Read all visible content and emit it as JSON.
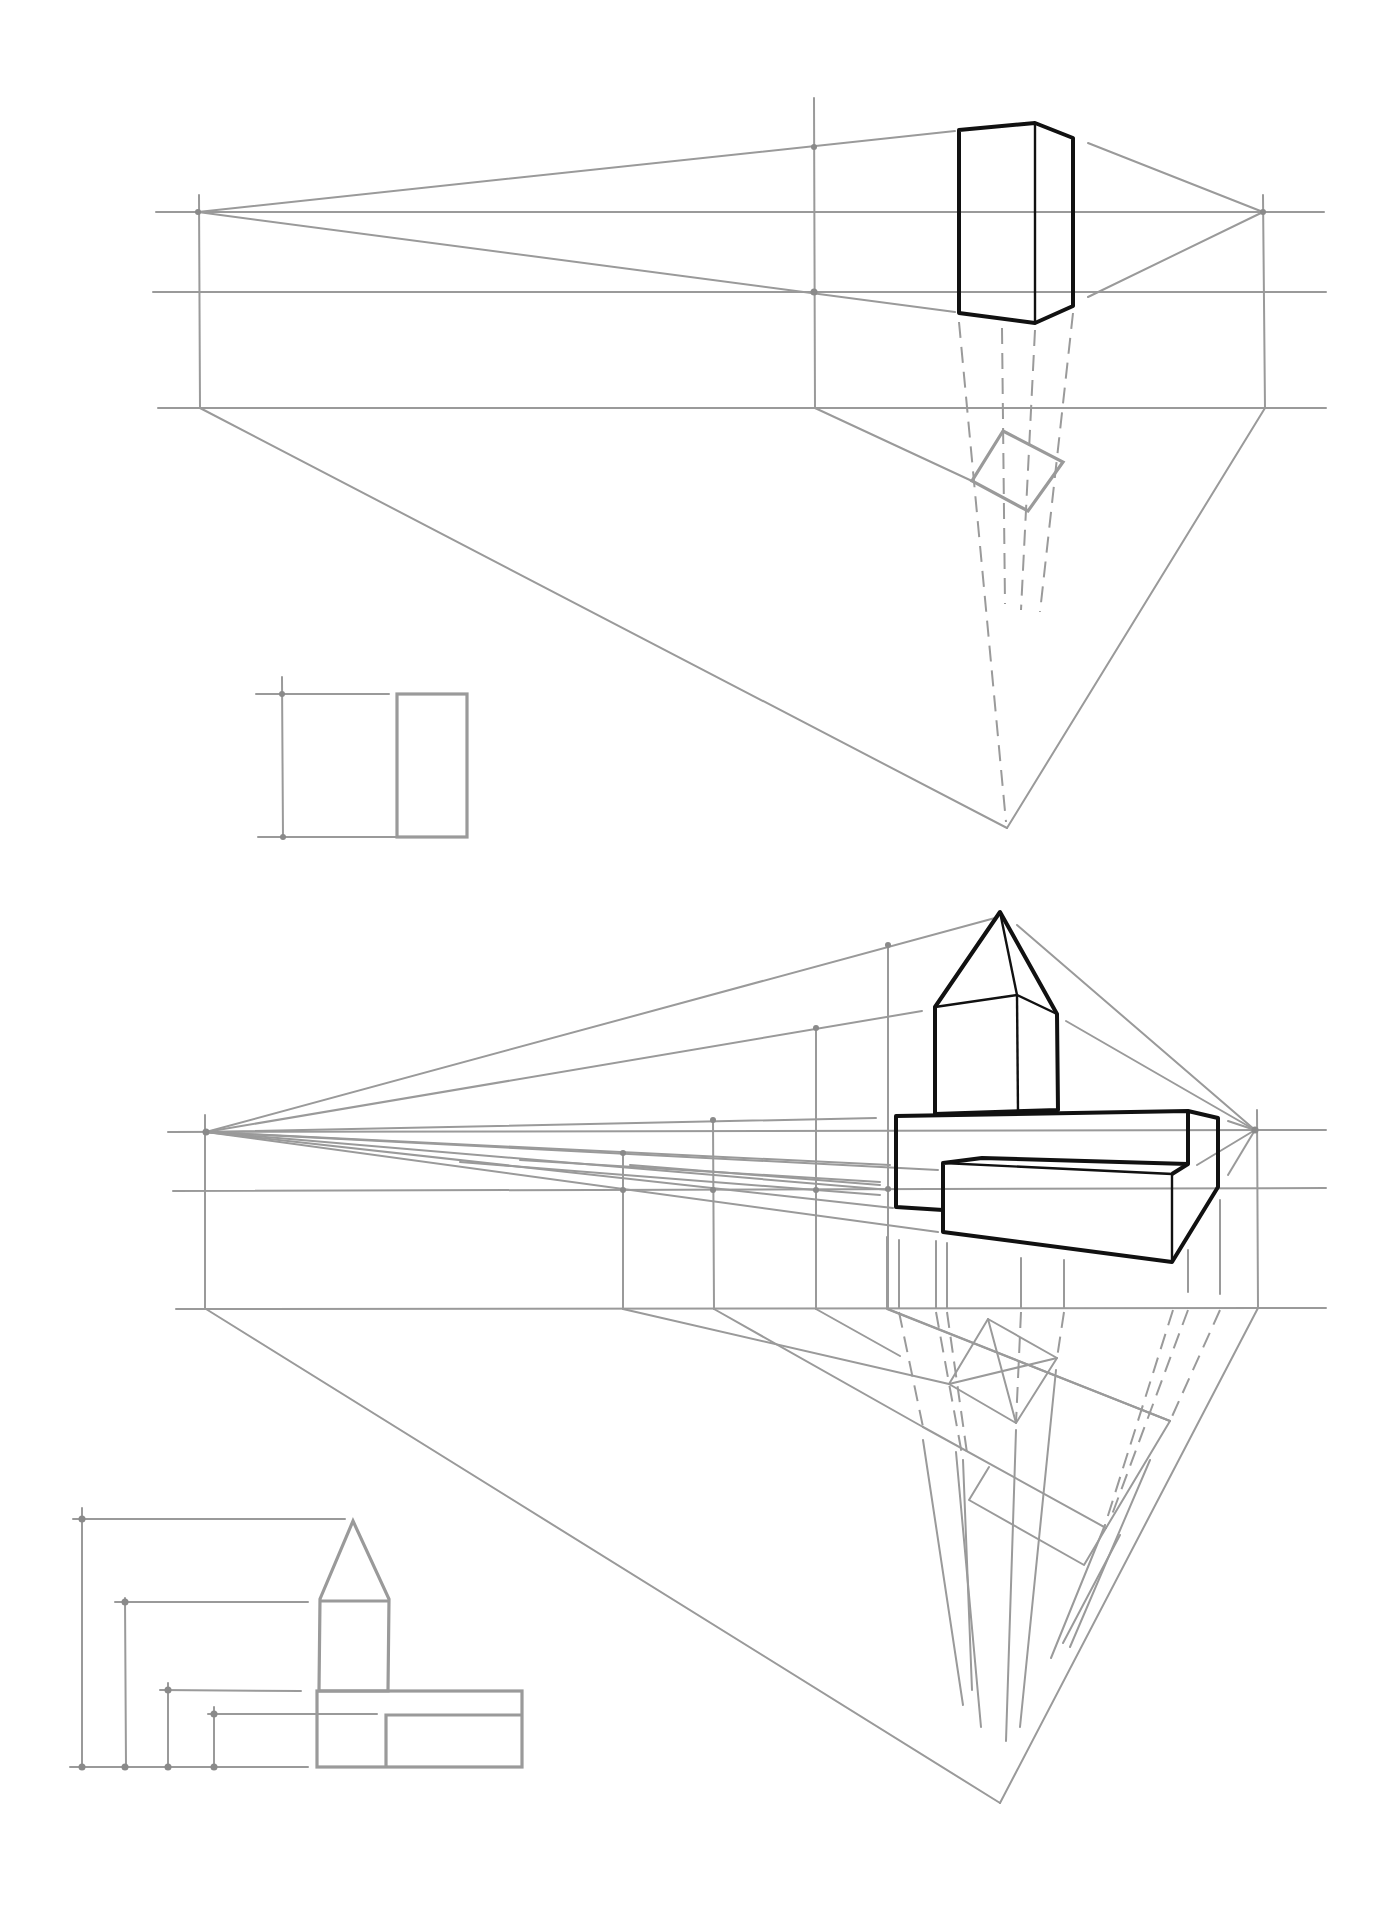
{
  "page": {
    "background": "#ffffff",
    "construction_color": "#9a9a9a",
    "object_color": "#111111"
  },
  "figures": [
    {
      "id": "figure-1",
      "subject": "rectangular prism in two-point perspective",
      "horizon_y": 212,
      "vanishing_points": [
        [
          198,
          212
        ],
        [
          1263,
          212
        ]
      ],
      "elevation": {
        "rect": [
          397,
          694,
          467,
          837
        ]
      }
    },
    {
      "id": "figure-2",
      "subject": "tower with pyramid roof on stepped slab in two-point perspective",
      "horizon_y": 1130,
      "vanishing_points": [
        [
          206,
          1132
        ],
        [
          1255,
          1130
        ]
      ],
      "elevation": {
        "tower_apex": [
          353,
          1521
        ]
      }
    }
  ]
}
